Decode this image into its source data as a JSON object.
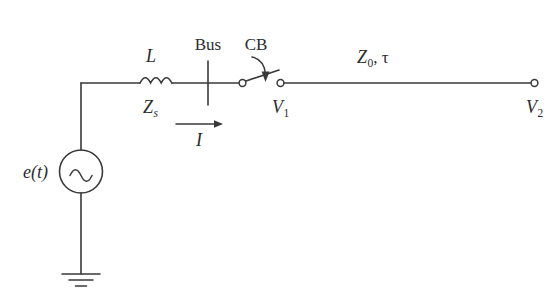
{
  "figure": {
    "type": "circuit-schematic",
    "background_color": "#ffffff",
    "line_color": "#3a3a3a"
  },
  "labels": {
    "source": "e(t)",
    "inductor": "L",
    "source_impedance": "Z",
    "source_impedance_sub": "s",
    "bus": "Bus",
    "breaker": "CB",
    "current": "I",
    "line_impedance": "Z",
    "line_impedance_sub": "0",
    "line_impedance_tail": ", ",
    "line_delay": "τ",
    "v1": "V",
    "v1_sub": "1",
    "v2": "V",
    "v2_sub": "2"
  },
  "components": [
    {
      "name": "ac-voltage-source",
      "label": "e(t)",
      "symbol": "circle-with-sine"
    },
    {
      "name": "series-inductor",
      "label": "L",
      "sublabel": "Zs",
      "symbol": "coil-three-loops"
    },
    {
      "name": "bus-bar",
      "label": "Bus",
      "symbol": "vertical-bar"
    },
    {
      "name": "circuit-breaker",
      "label": "CB",
      "symbol": "open-switch-with-arrow"
    },
    {
      "name": "transmission-line",
      "label": "Z0, τ",
      "symbol": "horizontal-line"
    },
    {
      "name": "ground",
      "label": "",
      "symbol": "three-bar-earth"
    }
  ],
  "nodes": [
    {
      "name": "v1-terminal",
      "label": "V1"
    },
    {
      "name": "v2-terminal",
      "label": "V2"
    }
  ],
  "annotations": [
    {
      "name": "current-arrow",
      "label": "I",
      "direction": "right"
    }
  ]
}
